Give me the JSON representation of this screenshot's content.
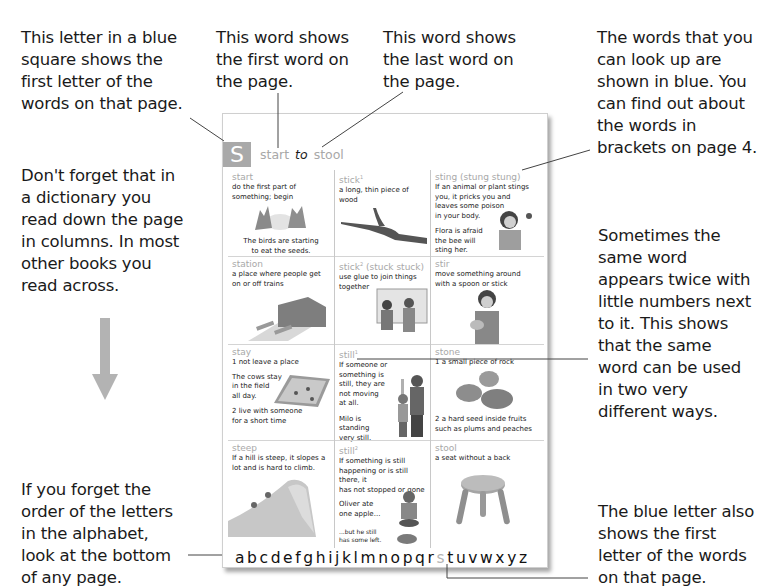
{
  "callouts": {
    "blue_square": [
      "This letter in a blue",
      "square shows the",
      "first letter of the",
      "words on that page."
    ],
    "first_word": [
      "This word shows",
      "the first word on",
      "the page."
    ],
    "last_word": [
      "This word shows",
      "the last word on",
      "the page."
    ],
    "blue_words": [
      "The words that you",
      "can look up are",
      "shown in blue. You",
      "can find out about",
      "the words in",
      "brackets on page 4."
    ],
    "read_down": [
      "Don't forget that in",
      "a dictionary you",
      "read down the page",
      "in columns. In most",
      "other books you",
      "read across."
    ],
    "same_word": [
      "Sometimes the",
      "same word",
      "appears twice with",
      "little numbers next",
      "to it. This shows",
      "that the same",
      "word can be used",
      "in two very",
      "different ways."
    ],
    "alphabet_order": [
      "If you forget the",
      "order of the letters",
      "in the alphabet,",
      "look at the bottom",
      "of any page."
    ],
    "blue_letter": [
      "The blue letter also",
      "shows the first",
      "letter of the words",
      "on that page."
    ]
  },
  "page": {
    "letter": "S",
    "guide_first": "start",
    "guide_to": "to",
    "guide_last": "stool",
    "columns": [
      [
        {
          "hw": "start",
          "sup": "",
          "forms": "",
          "def": [
            "do the first part of",
            "something; begin"
          ],
          "ex": [
            "The birds are starting",
            "to eat the seeds."
          ],
          "pic": "birds"
        },
        {
          "hw": "station",
          "sup": "",
          "forms": "",
          "def": [
            "a place where people get",
            "on or off trains"
          ],
          "ex": [],
          "pic": "station"
        },
        {
          "hw": "stay",
          "sup": "",
          "forms": "",
          "def": [
            "1  not leave a place"
          ],
          "ex": [
            "The cows stay",
            "in the field",
            "all day."
          ],
          "def2": [
            "2  live with someone",
            "for a short time"
          ],
          "pic": "field"
        },
        {
          "hw": "steep",
          "sup": "",
          "forms": "",
          "def": [
            "If a hill is steep, it slopes a",
            "lot and is hard to climb."
          ],
          "ex": [],
          "pic": "hill"
        }
      ],
      [
        {
          "hw": "stick",
          "sup": "1",
          "forms": "",
          "def": [
            "a long, thin piece of wood"
          ],
          "ex": [],
          "pic": "stick"
        },
        {
          "hw": "stick",
          "sup": "2",
          "forms": "(stuck stuck)",
          "def": [
            "use glue to join things",
            "together"
          ],
          "ex": [],
          "pic": "kids"
        },
        {
          "hw": "still",
          "sup": "1",
          "forms": "",
          "def": [
            "If someone or something is",
            "still, they are",
            "not moving",
            "at all."
          ],
          "ex": [
            "Milo is",
            "standing",
            "very still."
          ],
          "pic": "milo"
        },
        {
          "hw": "still",
          "sup": "2",
          "forms": "",
          "def": [
            "If something is still",
            "happening or is still there, it",
            "has not stopped or gone"
          ],
          "ex": [
            "Oliver ate",
            "one apple..."
          ],
          "ex2": [
            "...but he still",
            "has some left."
          ],
          "pic": "oliver"
        }
      ],
      [
        {
          "hw": "sting",
          "sup": "",
          "forms": "(stung stung)",
          "def": [
            "If an animal or plant stings",
            "you, it pricks you and",
            "leaves some poison",
            "in your body."
          ],
          "ex": [
            "Flora is afraid",
            "the bee will",
            "sting her."
          ],
          "pic": "flora"
        },
        {
          "hw": "stir",
          "sup": "",
          "forms": "",
          "def": [
            "move something around",
            "with a spoon or stick"
          ],
          "ex": [],
          "pic": "boy"
        },
        {
          "hw": "stone",
          "sup": "",
          "forms": "",
          "def": [
            "1  a small piece of rock"
          ],
          "ex": [],
          "def2": [
            "2  a hard seed inside fruits",
            "such as plums and peaches"
          ],
          "pic": "stones"
        },
        {
          "hw": "stool",
          "sup": "",
          "forms": "",
          "def": [
            "a seat without a back"
          ],
          "ex": [],
          "pic": "stool"
        }
      ]
    ],
    "alphabet": {
      "before": "abcdefghijklmnopqr",
      "current": "s",
      "after": "tuvwxyz"
    }
  },
  "colors": {
    "letter_box": "#a9a9a9",
    "headword": "#a8a8a8",
    "arrow": "#b3b3b3",
    "text": "#1a1a1a"
  }
}
